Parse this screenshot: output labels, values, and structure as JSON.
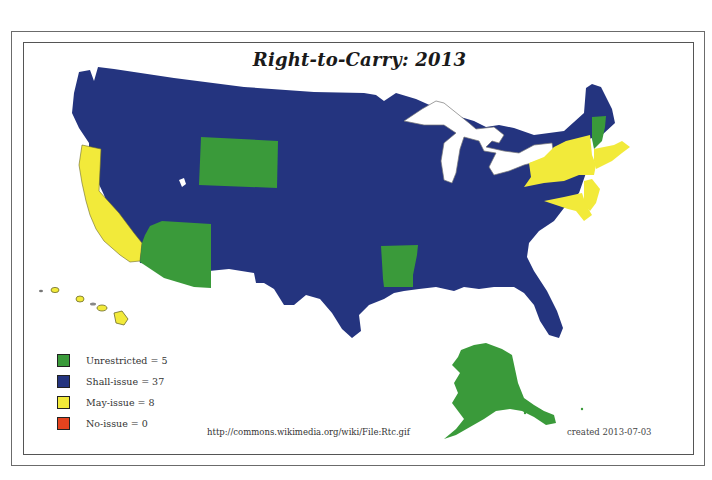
{
  "title": "Right-to-Carry: 2013",
  "colors": {
    "unrestricted": "#3a9a3a",
    "shall_issue": "#24347f",
    "may_issue": "#f2ea3a",
    "no_issue": "#e5431e",
    "lakes": "#ffffff"
  },
  "legend": [
    {
      "key": "unrestricted",
      "label": "Unrestricted = 5",
      "color": "#3a9a3a"
    },
    {
      "key": "shall_issue",
      "label": "Shall-issue = 37",
      "color": "#24347f"
    },
    {
      "key": "may_issue",
      "label": "May-issue = 8",
      "color": "#f2ea3a"
    },
    {
      "key": "no_issue",
      "label": "No-issue = 0",
      "color": "#e5431e"
    }
  ],
  "regions": {
    "unrestricted": [
      "Wyoming",
      "Arizona",
      "Arkansas",
      "Vermont",
      "Alaska"
    ],
    "may_issue": [
      "California",
      "Hawaii",
      "New York",
      "New Jersey",
      "Massachusetts",
      "Maryland",
      "Connecticut",
      "Rhode Island"
    ],
    "shall_issue_count": 37,
    "no_issue_count": 0
  },
  "footer": {
    "source": "http://commons.wikimedia.org/wiki/File:Rtc.gif",
    "created": "created 2013-07-03"
  }
}
